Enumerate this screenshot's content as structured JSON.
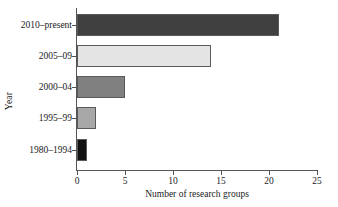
{
  "chart_data": {
    "type": "bar",
    "orientation": "horizontal",
    "title": "",
    "xlabel": "Number of research groups",
    "ylabel": "Year",
    "xlim": [
      0,
      25
    ],
    "xticks": [
      0,
      5,
      10,
      15,
      20,
      25
    ],
    "xtick_labels": [
      "0",
      "5",
      "10",
      "15",
      "20",
      "25"
    ],
    "grid": false,
    "legend": null,
    "categories": [
      "1980–1994",
      "1995–99",
      "2000–04",
      "2005–09",
      "2010–present"
    ],
    "values": [
      1,
      2,
      5,
      14,
      21
    ],
    "bars": [
      {
        "category": "2010–present",
        "value": 21,
        "color": "#404040"
      },
      {
        "category": "2005–09",
        "value": 14,
        "color": "#e4e4e4"
      },
      {
        "category": "2000–04",
        "value": 5,
        "color": "#808080"
      },
      {
        "category": "1995–99",
        "value": 2,
        "color": "#a8a8a8"
      },
      {
        "category": "1980–1994",
        "value": 1,
        "color": "#111111"
      }
    ],
    "axis_color": "#555555",
    "background_color": "#ffffff",
    "bar_edge_color": "#5a5a5a"
  }
}
